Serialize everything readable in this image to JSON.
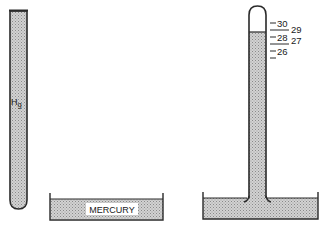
{
  "diagram": {
    "left_tube": {
      "label_main": "H",
      "label_sub": "g"
    },
    "left_dish": {
      "label": "MERCURY"
    },
    "right_scale": {
      "left_labels": [
        "30",
        "28",
        "26"
      ],
      "right_labels": [
        "29",
        "27"
      ]
    },
    "colors": {
      "mercury_fill": "#c8c8c8",
      "outline": "#2a2a2a",
      "background": "#ffffff"
    }
  }
}
